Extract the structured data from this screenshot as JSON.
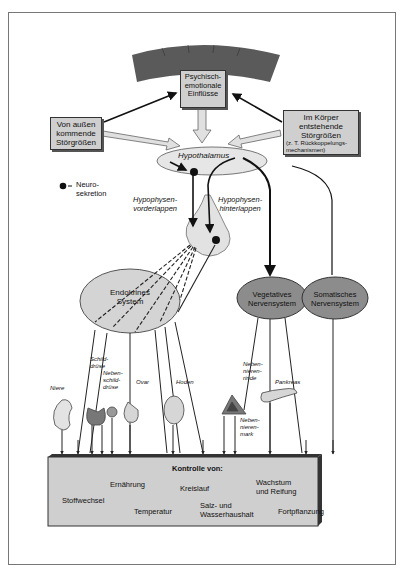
{
  "diagram": {
    "cortex_box": "Psychisch-\nemotionale\nEinflüsse",
    "external_box": "Von außen\nkommende\nStörgrößen",
    "internal_box_main": "Im Körper\nentstehende\nStörgrößen",
    "internal_box_sub": "(z. T. Rückkoppelungs-\nmechanismen)",
    "hypothalamus": "Hypothalamus",
    "legend_neuro": "Neuro-\nsekretion",
    "hvl": "Hypophysen-\nvorderlappen",
    "hhl": "Hypophysen-\nhinterlappen",
    "endocrine": "Endokrines\nSystem",
    "vegetative": "Vegetatives\nNervensystem",
    "somatic": "Somatisches\nNervensystem",
    "organs": {
      "niere": "Niere",
      "schilddruese": "Schild-\ndrüse",
      "nebenschild": "Neben-\nschild-\ndrüse",
      "ovar": "Ovar",
      "hoden": "Hoden",
      "nnr": "Neben-\nnieren-\nrinde",
      "nnm": "Neben-\nnieren-\nmark",
      "pankreas": "Pankreas"
    },
    "control": {
      "title": "Kontrolle von:",
      "items": [
        "Ernährung",
        "Kreislauf",
        "Wachstum\nund Reifung",
        "Stoffwechsel",
        "Temperatur",
        "Salz- und\nWasserhaushalt",
        "Fortpflanzung"
      ]
    },
    "colors": {
      "gland": "#8a8a8a",
      "ellipse_light": "#d4d4d4",
      "ellipse_dark": "#8c8c8c",
      "cortex": "#5a5a5a"
    }
  }
}
